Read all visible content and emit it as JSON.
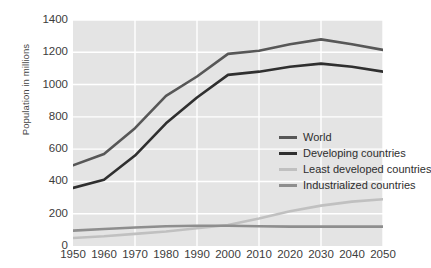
{
  "chart_data": {
    "type": "line",
    "title": "",
    "xlabel": "",
    "ylabel": "Population in millions",
    "x": [
      1950,
      1960,
      1970,
      1980,
      1990,
      2000,
      2010,
      2020,
      2030,
      2040,
      2050
    ],
    "xlim": [
      1950,
      2050
    ],
    "ylim": [
      0,
      1400
    ],
    "grid": true,
    "legend_position": "inside-center-right",
    "series": [
      {
        "name": "World",
        "color": "#575757",
        "values": [
          500,
          570,
          730,
          930,
          1050,
          1190,
          1210,
          1250,
          1280,
          1250,
          1215
        ]
      },
      {
        "name": "Developing countries",
        "color": "#2f2f2f",
        "values": [
          360,
          410,
          560,
          760,
          920,
          1060,
          1080,
          1110,
          1130,
          1110,
          1080
        ]
      },
      {
        "name": "Least developed countries",
        "color": "#c0c0c0",
        "values": [
          50,
          60,
          75,
          90,
          110,
          130,
          170,
          215,
          250,
          275,
          290
        ]
      },
      {
        "name": "Industrialized countries",
        "color": "#8e8e8e",
        "values": [
          95,
          105,
          115,
          122,
          125,
          125,
          122,
          120,
          120,
          120,
          120
        ]
      }
    ],
    "y_ticks": [
      0,
      200,
      400,
      600,
      800,
      1000,
      1200,
      1400
    ],
    "x_ticks": [
      "1950",
      "1960",
      "1970",
      "1980",
      "1990",
      "2000",
      "2010",
      "2020",
      "2030",
      "2040",
      "2050"
    ],
    "colors": {
      "plot_background": "#e4e4e4",
      "gridline": "#ffffff",
      "page_background": "#ffffff",
      "tick_text": "#3c3c3c",
      "axis_title_text": "#444444"
    }
  }
}
